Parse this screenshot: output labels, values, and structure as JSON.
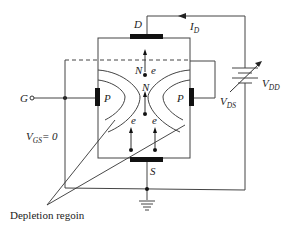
{
  "diagram": {
    "terminals": {
      "drain": "D",
      "source": "S",
      "gate": "G"
    },
    "regions": {
      "channel_top": "N",
      "channel_mid": "N",
      "gate_left": "P",
      "gate_right": "P"
    },
    "carriers": {
      "top": "e",
      "left": "e",
      "right": "e",
      "bottom": "e"
    },
    "current": {
      "label": "I",
      "sub": "D"
    },
    "supply": {
      "label": "V",
      "sub": "DD"
    },
    "vds": {
      "label": "V",
      "sub": "DS"
    },
    "vgs": {
      "label": "V",
      "sub": "GS",
      "value": "= 0"
    },
    "annotation": "Depletion regoin",
    "colors": {
      "line": "#333333",
      "plate": "#111111"
    }
  }
}
